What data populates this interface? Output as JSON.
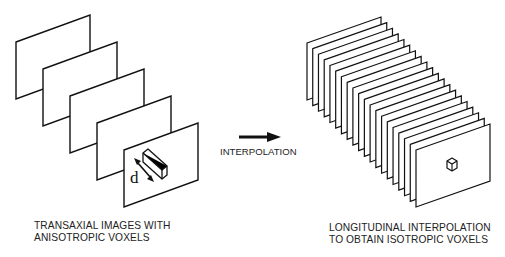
{
  "diagram": {
    "left_panel": {
      "name": "transaxial-images",
      "plane_count": 5,
      "plane_width": 74,
      "plane_height": 57,
      "plane_skew": -27,
      "first_plane_top_left": [
        16,
        42
      ],
      "plane_step": [
        27,
        27
      ],
      "voxel_label": "d",
      "caption": [
        "TRANSAXIAL IMAGES WITH",
        "ANISOTROPIC VOXELS"
      ]
    },
    "arrow": {
      "label": "INTERPOLATION",
      "from": [
        239,
        137
      ],
      "to": [
        281,
        137
      ]
    },
    "right_panel": {
      "name": "interpolated-stack",
      "plane_count": 20,
      "plane_width": 74,
      "plane_height": 57,
      "plane_skew": -26,
      "first_plane_top_left": [
        307,
        43
      ],
      "last_plane_top_left": [
        416,
        150
      ],
      "caption": [
        "LONGITUDINAL INTERPOLATION",
        "TO OBTAIN ISOTROPIC VOXELS"
      ]
    },
    "colors": {
      "line": "#111111",
      "fill": "#ffffff",
      "text": "#222222"
    }
  }
}
